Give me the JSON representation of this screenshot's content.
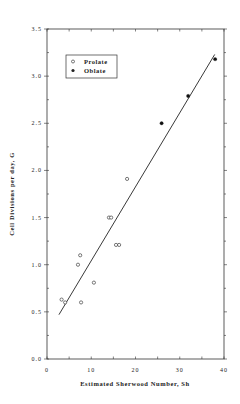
{
  "chart_data": {
    "type": "scatter",
    "title": "",
    "xlabel": "Estimated Sherwood Number, Sh",
    "ylabel": "Cell Divisions per day, G",
    "xlim": [
      0,
      40
    ],
    "ylim": [
      0,
      3.5
    ],
    "x_ticks": [
      "0",
      "10",
      "20",
      "30",
      "40"
    ],
    "y_ticks": [
      "0.0",
      "0.5",
      "1.0",
      "1.5",
      "2.0",
      "2.5",
      "3.0",
      "3.5"
    ],
    "grid": false,
    "legend_position": "upper left",
    "series": [
      {
        "name": "Prolate",
        "marker": "open-circle",
        "points": [
          [
            3.3,
            0.63
          ],
          [
            4.1,
            0.6
          ],
          [
            7.0,
            1.0
          ],
          [
            7.5,
            1.1
          ],
          [
            7.7,
            0.6
          ],
          [
            10.6,
            0.81
          ],
          [
            14.0,
            1.5
          ],
          [
            14.5,
            1.5
          ],
          [
            15.6,
            1.21
          ],
          [
            16.3,
            1.21
          ],
          [
            18.1,
            1.91
          ]
        ]
      },
      {
        "name": "Oblate",
        "marker": "filled-circle",
        "points": [
          [
            25.9,
            2.5
          ],
          [
            31.9,
            2.79
          ],
          [
            38.0,
            3.18
          ]
        ]
      }
    ],
    "fit_line": {
      "x": [
        2.7,
        37.9
      ],
      "y": [
        0.47,
        3.23
      ]
    }
  },
  "legend": {
    "items": [
      {
        "label": "Prolate",
        "marker": "open-circle"
      },
      {
        "label": "Oblate",
        "marker": "filled-circle"
      }
    ]
  }
}
